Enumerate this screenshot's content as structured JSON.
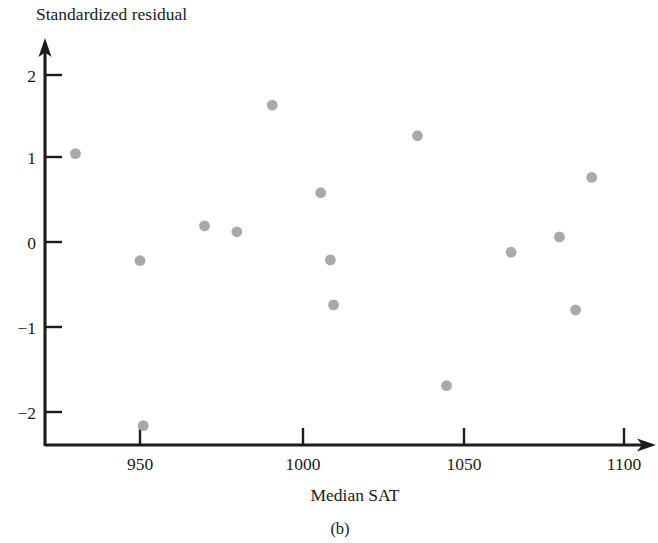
{
  "figure": {
    "caption": "(b)",
    "background_color": "#ffffff",
    "axis_color": "#1c1c1c",
    "point_color": "#a9a9a9"
  },
  "chart_data": {
    "type": "scatter",
    "title": "",
    "ylabel": "Standardized residual",
    "xlabel": "Median SAT",
    "xlim": [
      920,
      1105
    ],
    "ylim": [
      -2.45,
      2.35
    ],
    "xticks": [
      950,
      1000,
      1050,
      1100
    ],
    "xtick_labels": [
      "950",
      "1000",
      "1050",
      "1100"
    ],
    "yticks": [
      2,
      1,
      0,
      -1,
      -2
    ],
    "ytick_labels": [
      "2",
      "1",
      "0",
      "−1",
      "−2"
    ],
    "grid": false,
    "legend": null,
    "points": [
      {
        "x": 930,
        "y": 1.04
      },
      {
        "x": 950,
        "y": -0.22
      },
      {
        "x": 951,
        "y": -2.16
      },
      {
        "x": 970,
        "y": 0.19
      },
      {
        "x": 980,
        "y": 0.12
      },
      {
        "x": 991,
        "y": 1.61
      },
      {
        "x": 1006,
        "y": 0.58
      },
      {
        "x": 1009,
        "y": -0.21
      },
      {
        "x": 1010,
        "y": -0.74
      },
      {
        "x": 1036,
        "y": 1.25
      },
      {
        "x": 1045,
        "y": -1.69
      },
      {
        "x": 1065,
        "y": -0.12
      },
      {
        "x": 1080,
        "y": 0.06
      },
      {
        "x": 1085,
        "y": -0.8
      },
      {
        "x": 1090,
        "y": 0.76
      }
    ]
  }
}
